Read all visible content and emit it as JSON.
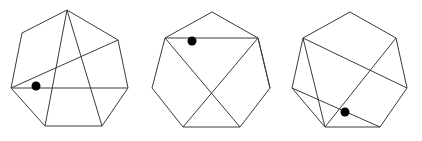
{
  "figure": {
    "title": "",
    "canvas": {
      "width": 422,
      "height": 141
    },
    "background_color": "#ffffff",
    "stroke_color": "#3a3a3a",
    "marker_color": "#000000",
    "stroke_width": 1,
    "marker_radius": 4.5,
    "panel_count": 3,
    "panels": [
      {
        "name": "heptagon-1",
        "vertices": [
          {
            "name": "top",
            "x": 67,
            "y": 10
          },
          {
            "name": "top-right",
            "x": 118,
            "y": 40
          },
          {
            "name": "right",
            "x": 128,
            "y": 88
          },
          {
            "name": "bottom-right",
            "x": 102,
            "y": 126
          },
          {
            "name": "bottom-left",
            "x": 45,
            "y": 126
          },
          {
            "name": "left",
            "x": 11,
            "y": 88
          },
          {
            "name": "top-left",
            "x": 22,
            "y": 33
          }
        ],
        "outline_points": "67,10 118,40 128,88 102,126 45,126 11,88 22,33",
        "chords": [
          {
            "name": "chord-left-to-top-right",
            "x1": 11,
            "y1": 88,
            "x2": 118,
            "y2": 40
          },
          {
            "name": "chord-left-to-right",
            "x1": 11,
            "y1": 88,
            "x2": 128,
            "y2": 88
          },
          {
            "name": "chord-top-to-bottom-left",
            "x1": 67,
            "y1": 10,
            "x2": 45,
            "y2": 126
          },
          {
            "name": "chord-top-to-bottom-right",
            "x1": 67,
            "y1": 10,
            "x2": 102,
            "y2": 126
          }
        ],
        "marker": {
          "name": "marker-dot-1",
          "x": 36,
          "y": 86,
          "r": 4.5
        }
      },
      {
        "name": "heptagon-2",
        "vertices": [
          {
            "name": "top",
            "x": 212,
            "y": 12
          },
          {
            "name": "top-right",
            "x": 258,
            "y": 38
          },
          {
            "name": "right",
            "x": 270,
            "y": 88
          },
          {
            "name": "bottom-right",
            "x": 240,
            "y": 127
          },
          {
            "name": "bottom-left",
            "x": 183,
            "y": 127
          },
          {
            "name": "left",
            "x": 152,
            "y": 88
          },
          {
            "name": "top-left",
            "x": 165,
            "y": 38
          }
        ],
        "outline_points": "212,12 258,38 270,88 240,127 183,127 152,88 165,38",
        "chords": [
          {
            "name": "chord-top-left-to-top-right",
            "x1": 165,
            "y1": 38,
            "x2": 258,
            "y2": 38
          },
          {
            "name": "chord-top-left-to-bottom-right",
            "x1": 165,
            "y1": 38,
            "x2": 240,
            "y2": 127
          },
          {
            "name": "chord-top-right-to-bottom-left",
            "x1": 258,
            "y1": 38,
            "x2": 183,
            "y2": 127
          },
          {
            "name": "chord-top-right-to-right",
            "x1": 258,
            "y1": 38,
            "x2": 270,
            "y2": 88
          }
        ],
        "marker": {
          "name": "marker-dot-2",
          "x": 192,
          "y": 41,
          "r": 4.5
        }
      },
      {
        "name": "heptagon-3",
        "vertices": [
          {
            "name": "top",
            "x": 350,
            "y": 12
          },
          {
            "name": "top-right",
            "x": 396,
            "y": 38
          },
          {
            "name": "right",
            "x": 407,
            "y": 88
          },
          {
            "name": "bottom-right",
            "x": 380,
            "y": 127
          },
          {
            "name": "bottom-left",
            "x": 325,
            "y": 127
          },
          {
            "name": "left",
            "x": 292,
            "y": 88
          },
          {
            "name": "top-left",
            "x": 303,
            "y": 38
          }
        ],
        "outline_points": "350,12 396,38 407,88 380,127 325,127 292,88 303,38",
        "chords": [
          {
            "name": "chord-top-left-to-bottom-left",
            "x1": 303,
            "y1": 38,
            "x2": 325,
            "y2": 127
          },
          {
            "name": "chord-top-left-to-right",
            "x1": 303,
            "y1": 38,
            "x2": 407,
            "y2": 88
          },
          {
            "name": "chord-top-right-to-bottom-left",
            "x1": 396,
            "y1": 38,
            "x2": 325,
            "y2": 127
          },
          {
            "name": "chord-left-to-bottom-right",
            "x1": 292,
            "y1": 88,
            "x2": 380,
            "y2": 127
          }
        ],
        "marker": {
          "name": "marker-dot-3",
          "x": 345,
          "y": 112,
          "r": 4.5
        }
      }
    ]
  }
}
